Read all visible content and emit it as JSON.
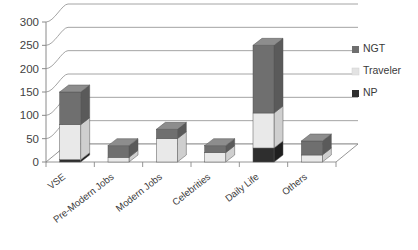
{
  "chart_data": {
    "type": "bar",
    "subtype": "stacked-3d-column",
    "title": "",
    "xlabel": "",
    "ylabel": "",
    "ylim": [
      0,
      300
    ],
    "ytick_step": 50,
    "yticks": [
      "0",
      "50",
      "100",
      "150",
      "200",
      "250",
      "300"
    ],
    "grid": true,
    "grid_axis": "y",
    "legend_position": "right",
    "categories": [
      "VSE",
      "Pre-Modern Jobs",
      "Modern Jobs",
      "Celebrities",
      "Daily Life",
      "Others"
    ],
    "series": [
      {
        "name": "NP",
        "color": "#2e2e2e",
        "values": [
          5,
          0,
          0,
          0,
          30,
          0
        ]
      },
      {
        "name": "Traveler",
        "color": "#e9e9e9",
        "values": [
          75,
          10,
          50,
          20,
          75,
          15
        ]
      },
      {
        "name": "NGT",
        "color": "#6f6f6f",
        "values": [
          70,
          25,
          20,
          15,
          145,
          30
        ]
      }
    ],
    "stack_order": [
      "NP",
      "Traveler",
      "NGT"
    ],
    "totals": [
      150,
      35,
      70,
      35,
      250,
      45
    ]
  },
  "legend": {
    "entries": [
      {
        "label": "NGT",
        "color": "#6f6f6f"
      },
      {
        "label": "Traveler",
        "color": "#e3e3e3"
      },
      {
        "label": "NP",
        "color": "#2e2e2e"
      }
    ]
  },
  "colors": {
    "axis": "#8a8a8a",
    "grid": "#9a9a9a",
    "floor": "#ffffff",
    "text": "#3a3a3a",
    "ngt": "#6f6f6f",
    "ngt_top": "#8d8d8d",
    "ngt_side": "#5a5a5a",
    "traveler": "#e9e9e9",
    "traveler_top": "#f4f4f4",
    "traveler_side": "#cfcfcf",
    "np": "#2e2e2e",
    "np_top": "#4a4a4a",
    "np_side": "#1f1f1f"
  }
}
